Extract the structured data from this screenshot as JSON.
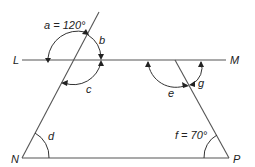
{
  "diagram": {
    "type": "geometry-angles",
    "points": {
      "L": "L",
      "M": "M",
      "N": "N",
      "P": "P"
    },
    "angles": {
      "a": "a = 120°",
      "b": "b",
      "c": "c",
      "d": "d",
      "e": "e",
      "f": "f = 70°",
      "g": "g"
    },
    "colors": {
      "line": "#555555",
      "text": "#222222",
      "background": "#ffffff"
    }
  }
}
